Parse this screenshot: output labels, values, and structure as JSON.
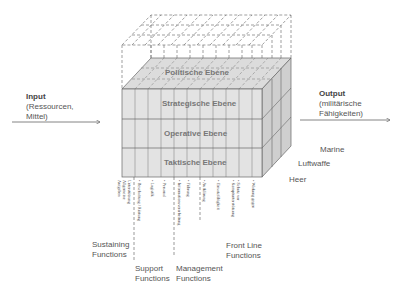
{
  "input": {
    "title": "Input",
    "line1": "(Ressourcen,",
    "line2": "Mittel)"
  },
  "output": {
    "title": "Output",
    "line1": "(militärische",
    "line2": "Fähigkeiten)"
  },
  "levels": {
    "top": "Politische Ebene",
    "rows": [
      "Strategische Ebene",
      "Operative Ebene",
      "Taktische Ebene"
    ]
  },
  "branches": [
    "Marine",
    "Luftwaffe",
    "Heer"
  ],
  "function_groups": {
    "sustaining": {
      "line1": "Sustaining",
      "line2": "Functions"
    },
    "support": {
      "line1": "Support",
      "line2": "Functions"
    },
    "management": {
      "line1": "Management",
      "line2": "Functions"
    },
    "front_line": {
      "line1": "Front Line",
      "line2": "Functions"
    }
  },
  "function_items": {
    "sustaining": [
      "Aufgaben",
      "Allgemeine",
      "Unterstützung"
    ],
    "support": [
      "• Beschaffung / Rüstung",
      "• Logistik",
      "• Personal"
    ],
    "management": [
      "• Informationsverarbeitung",
      "• Führung",
      "• Aufklärung"
    ],
    "front_line": [
      "• Einsatzfähigkeit",
      "• Kampfunterstützung",
      "• Schutz vor",
      "• Wirkung gegen"
    ]
  },
  "colors": {
    "face_front": "#e2e2e2",
    "face_top": "#d9d9d9",
    "face_right": "#cfcfcf",
    "line": "#666666",
    "dashed": "#777777",
    "text": "#555555"
  }
}
